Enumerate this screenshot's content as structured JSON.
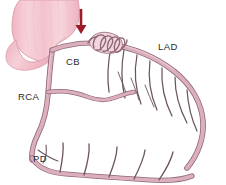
{
  "figure": {
    "background_color": "#ffffff",
    "width": 226,
    "height": 185
  },
  "palette": {
    "aorta_fill": "#f2bcc6",
    "aorta_fill_light": "#f7d3da",
    "aorta_outline": "#d79aa8",
    "vessel_fill": "#dcafbd",
    "vessel_outline": "#8e6675",
    "branch_stroke": "#6b5560",
    "arrow_color": "#9c1c2a",
    "stent_stroke": "#8e6675",
    "label_color": "#2b2b2b"
  },
  "labels": [
    {
      "id": "cb",
      "text": "CB",
      "x": 66,
      "y": 65,
      "anchor": "start"
    },
    {
      "id": "lad",
      "text": "LAD",
      "x": 158,
      "y": 50,
      "anchor": "start"
    },
    {
      "id": "rca",
      "text": "RCA",
      "x": 18,
      "y": 100,
      "anchor": "start"
    },
    {
      "id": "pd",
      "text": "PD",
      "x": 33,
      "y": 162,
      "anchor": "start"
    }
  ],
  "annotations": {
    "arrow": {
      "name": "down-arrow",
      "color": "#9c1c2a",
      "x": 81,
      "y_top": 9,
      "y_bottom": 34,
      "points_to": "CB stent"
    },
    "stent": {
      "name": "coil-stent",
      "description": "coiled spring stent on conus branch",
      "coil_count": 5
    }
  },
  "structures": [
    {
      "id": "aorta",
      "label": "Aorta / great vessel",
      "type": "organ"
    },
    {
      "id": "rca-vessel",
      "label": "RCA",
      "type": "artery"
    },
    {
      "id": "cb-vessel",
      "label": "CB",
      "type": "artery"
    },
    {
      "id": "lad-vessel",
      "label": "LAD",
      "type": "artery"
    },
    {
      "id": "pd-vessel",
      "label": "PD",
      "type": "artery"
    },
    {
      "id": "diagonal-branches",
      "label": "Diagonal branches",
      "type": "branches",
      "count": 7
    },
    {
      "id": "septal-branches",
      "label": "Septal branches",
      "type": "branches",
      "count": 5
    }
  ]
}
